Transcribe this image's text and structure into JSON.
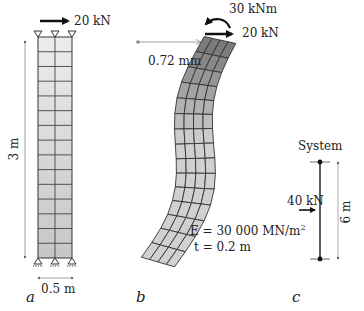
{
  "panel_a": {
    "label": "a",
    "load_top": "20 kN",
    "height_dim": "3 m",
    "width_dim": "0.5 m",
    "mesh": {
      "columns": 2,
      "rows": 15
    }
  },
  "panel_b": {
    "label": "b",
    "moment_top": "30 kNm",
    "load_top": "20 kN",
    "displacement": "0.72 mm",
    "modulus": "E = 30 000 MN/m²",
    "thickness": "t = 0.2 m",
    "mesh": {
      "columns": 4,
      "rows": 15
    }
  },
  "panel_c": {
    "label": "c",
    "title": "System",
    "load": "40 kN",
    "height_dim": "6 m"
  },
  "colors": {
    "line": "#222222",
    "mesh_line": "#333333",
    "fill_light": "#e8e8e8",
    "fill_mid": "#c8c8c8",
    "fill_dark": "#777777",
    "dim_line": "#888888"
  }
}
